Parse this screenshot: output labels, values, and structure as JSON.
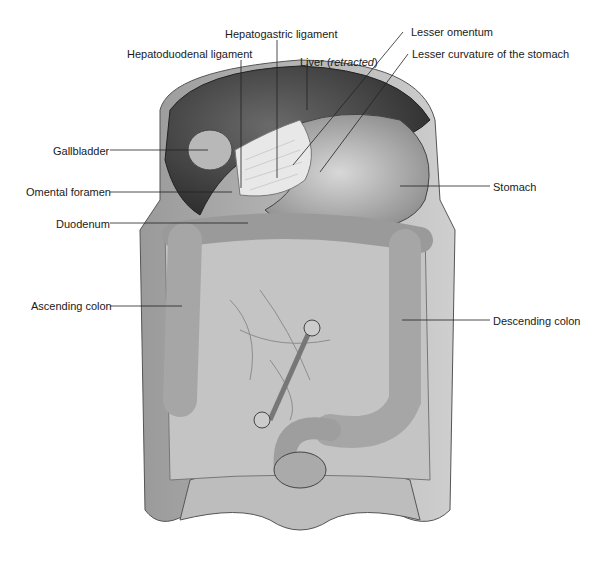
{
  "figure": {
    "labels": {
      "hepatogastric_ligament": "Hepatogastric ligament",
      "hepatoduodenal_ligament": "Hepatoduodenal ligament",
      "liver_prefix": "Liver (",
      "liver_italic": "retracted",
      "liver_suffix": ")",
      "lesser_omentum": "Lesser omentum",
      "lesser_curvature": "Lesser curvature of the stomach",
      "gallbladder": "Gallbladder",
      "omental_foramen": "Omental foramen",
      "duodenum": "Duodenum",
      "stomach": "Stomach",
      "ascending_colon": "Ascending colon",
      "descending_colon": "Descending colon"
    }
  }
}
